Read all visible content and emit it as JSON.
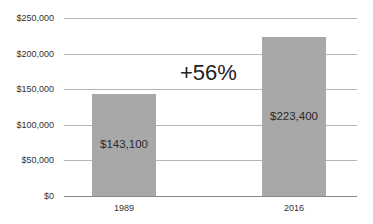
{
  "chart_data": {
    "type": "bar",
    "title": "",
    "xlabel": "",
    "ylabel": "",
    "categories": [
      "1989",
      "2016"
    ],
    "values": [
      143100,
      223400
    ],
    "data_labels": [
      "$143,100",
      "$223,400"
    ],
    "ylim": [
      0,
      250000
    ],
    "yticks": [
      0,
      50000,
      100000,
      150000,
      200000,
      250000
    ],
    "ytick_labels": [
      "$0",
      "$50,000",
      "$100,000",
      "$150,000",
      "$200,000",
      "$250,000"
    ],
    "grid": true,
    "legend": null,
    "annotations": [
      "+56%"
    ],
    "bar_color": "#a8a8a8"
  },
  "annotation": "+56%"
}
